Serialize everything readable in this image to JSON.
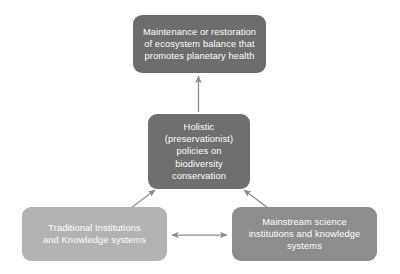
{
  "diagram": {
    "background_color": "#ffffff",
    "nodes": [
      {
        "id": "outcome",
        "label": "Maintenance or restoration\nof ecosystem balance that\npromotes planetary health",
        "color": "#6d6d6d",
        "text_color": "#ffffff"
      },
      {
        "id": "policy",
        "label": "Holistic\n(preservationist)\npolicies on\nbiodiversity\nconservation",
        "color": "#6f6f6f",
        "text_color": "#ffffff"
      },
      {
        "id": "traditional",
        "label": "Traditional Institutions\nand Knowledge systems",
        "color": "#b3b3b3",
        "text_color": "#ffffff"
      },
      {
        "id": "mainstream",
        "label": "Mainstream science\ninstitutions and knowledge\nsystems",
        "color": "#8d8d8d",
        "text_color": "#ffffff"
      }
    ],
    "connectors": [
      {
        "id": "policy-to-outcome",
        "from": "policy",
        "to": "outcome",
        "direction": "single",
        "orientation": "vertical",
        "color": "#8c8c8c"
      },
      {
        "id": "traditional-to-policy",
        "from": "traditional",
        "to": "policy",
        "direction": "single",
        "orientation": "diagonal-up-right",
        "color": "#8c8c8c"
      },
      {
        "id": "mainstream-to-policy",
        "from": "mainstream",
        "to": "policy",
        "direction": "single",
        "orientation": "diagonal-up-left",
        "color": "#8c8c8c"
      },
      {
        "id": "traditional-mainstream-link",
        "from": "traditional",
        "to": "mainstream",
        "direction": "double",
        "orientation": "horizontal",
        "color": "#8c8c8c"
      }
    ]
  }
}
